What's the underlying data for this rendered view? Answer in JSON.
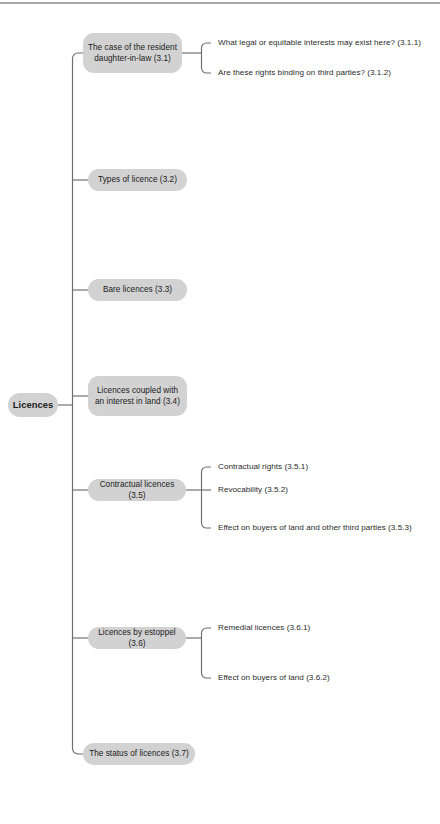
{
  "document": {
    "type": "mind-map",
    "orientation": "left-to-right",
    "theme": {
      "page_background": "#ffffff",
      "node_fill": "#d2d2d2",
      "node_text": "#1a1a1a",
      "leaf_text": "#2b2b2b",
      "connector": "#6d6d6d",
      "top_rule": "#a9a9ab"
    }
  },
  "root": {
    "label": "Licences",
    "bold": true
  },
  "branches": [
    {
      "id": "3.1",
      "label": "The case of the resident\ndaughter-in-law (3.1)",
      "children": [
        {
          "id": "3.1.1",
          "label": "What legal or equitable interests may exist here? (3.1.1)"
        },
        {
          "id": "3.1.2",
          "label": "Are these rights binding on third parties? (3.1.2)"
        }
      ]
    },
    {
      "id": "3.2",
      "label": "Types of licence (3.2)",
      "children": []
    },
    {
      "id": "3.3",
      "label": "Bare licences (3.3)",
      "children": []
    },
    {
      "id": "3.4",
      "label": "Licences coupled with\nan interest in land (3.4)",
      "children": []
    },
    {
      "id": "3.5",
      "label": "Contractual licences (3.5)",
      "children": [
        {
          "id": "3.5.1",
          "label": "Contractual rights (3.5.1)"
        },
        {
          "id": "3.5.2",
          "label": "Revocability (3.5.2)"
        },
        {
          "id": "3.5.3",
          "label": "Effect on buyers of land and other third parties (3.5.3)"
        }
      ]
    },
    {
      "id": "3.6",
      "label": "Licences by estoppel (3.6)",
      "children": [
        {
          "id": "3.6.1",
          "label": "Remedial licences (3.6.1)"
        },
        {
          "id": "3.6.2",
          "label": "Effect on buyers of land (3.6.2)"
        }
      ]
    },
    {
      "id": "3.7",
      "label": "The status of licences (3.7)",
      "children": []
    }
  ]
}
